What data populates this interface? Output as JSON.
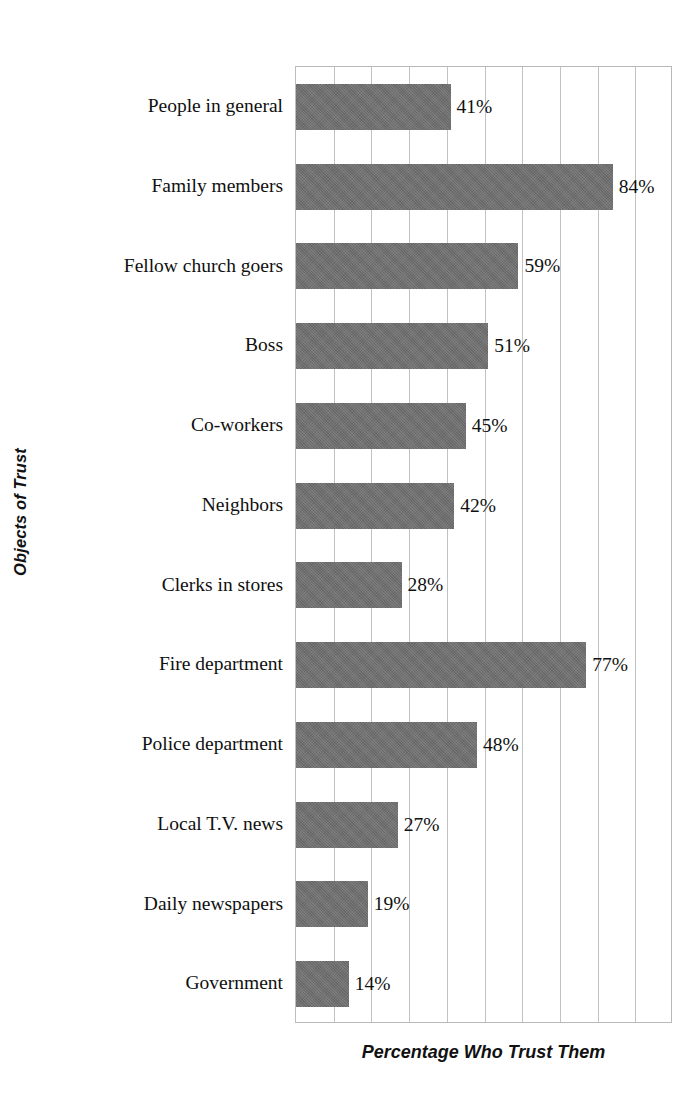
{
  "chart_data": {
    "type": "bar",
    "orientation": "horizontal",
    "title": "",
    "xlabel": "Percentage Who Trust Them",
    "ylabel": "Objects of Trust",
    "categories": [
      "People in general",
      "Family members",
      "Fellow church goers",
      "Boss",
      "Co-workers",
      "Neighbors",
      "Clerks in stores",
      "Fire department",
      "Police department",
      "Local T.V. news",
      "Daily newspapers",
      "Government"
    ],
    "values": [
      41,
      84,
      59,
      51,
      45,
      42,
      28,
      77,
      48,
      27,
      19,
      14
    ],
    "value_labels": [
      "41%",
      "84%",
      "59%",
      "51%",
      "45%",
      "42%",
      "28%",
      "77%",
      "48%",
      "27%",
      "19%",
      "14%"
    ],
    "xlim": [
      0,
      100
    ],
    "xtick_interval": 10,
    "xticklabels_visible": false,
    "grid": "vertical",
    "legend": null,
    "bar_color": "#6e6e6e",
    "gridline_color": "#c2c2c2",
    "plot_border_color": "#b9b9b9",
    "background_color": "#ffffff"
  }
}
